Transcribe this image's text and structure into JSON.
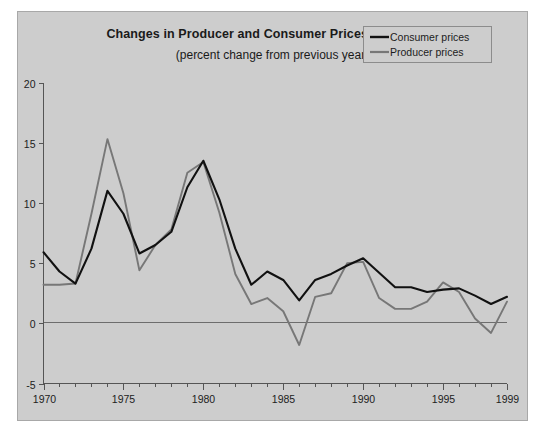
{
  "chart_data": {
    "type": "line",
    "title": "Changes in Producer and Consumer Prices, 1970–1999",
    "subtitle": "(percent change from previous year)",
    "xlabel": "",
    "ylabel": "",
    "xlim": [
      1970,
      1999
    ],
    "ylim": [
      -5,
      20
    ],
    "grid": false,
    "legend_position": "top-right",
    "x": [
      1970,
      1971,
      1972,
      1973,
      1974,
      1975,
      1976,
      1977,
      1978,
      1979,
      1980,
      1981,
      1982,
      1983,
      1984,
      1985,
      1986,
      1987,
      1988,
      1989,
      1990,
      1991,
      1992,
      1993,
      1994,
      1995,
      1996,
      1997,
      1998,
      1999
    ],
    "xticks": [
      1970,
      1975,
      1980,
      1985,
      1990,
      1995,
      1999
    ],
    "xticklabels": [
      "1970",
      "1975",
      "1980",
      "1985",
      "1990",
      "1995",
      "1999"
    ],
    "yticks": [
      -5,
      0,
      5,
      10,
      15,
      20
    ],
    "yticklabels": [
      "-5",
      "0",
      "5",
      "10",
      "15",
      "20"
    ],
    "series": [
      {
        "name": "Consumer prices",
        "color": "#111111",
        "values": [
          5.9,
          4.3,
          3.3,
          6.2,
          11.0,
          9.1,
          5.8,
          6.5,
          7.6,
          11.3,
          13.5,
          10.3,
          6.2,
          3.2,
          4.3,
          3.6,
          1.9,
          3.6,
          4.1,
          4.8,
          5.4,
          4.2,
          3.0,
          3.0,
          2.6,
          2.8,
          2.9,
          2.3,
          1.6,
          2.2
        ]
      },
      {
        "name": "Producer prices",
        "color": "#777777",
        "values": [
          3.2,
          3.2,
          3.3,
          9.1,
          15.3,
          10.8,
          4.4,
          6.5,
          7.8,
          12.5,
          13.4,
          9.2,
          4.1,
          1.6,
          2.1,
          1.0,
          -1.8,
          2.2,
          2.5,
          5.0,
          5.1,
          2.1,
          1.2,
          1.2,
          1.8,
          3.4,
          2.6,
          0.4,
          -0.8,
          1.8
        ]
      }
    ]
  },
  "legend": {
    "items": [
      {
        "label": "Consumer prices",
        "color": "#111111"
      },
      {
        "label": "Producer prices",
        "color": "#777777"
      }
    ]
  },
  "figure": {
    "background": "#cdcdcd",
    "outer_background": "#ffffff",
    "border_color": "#a8a8a8"
  }
}
